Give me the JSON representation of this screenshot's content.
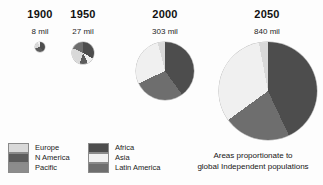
{
  "figure": {
    "title": "",
    "background": "#fdfdfd",
    "caption_line1": "Areas proportionate to",
    "caption_line2": "global Independent populations"
  },
  "colors": {
    "europe": "#d9d9d9",
    "n_america": "#5c5c5c",
    "pacific": "#8c8c8c",
    "africa": "#4d4d4d",
    "asia": "#f0f0f0",
    "latin_america": "#6e6e6e",
    "outline": "#8a8a8a",
    "text": "#1a1a1a"
  },
  "columns": [
    {
      "year": "1900",
      "value": "8 mil"
    },
    {
      "year": "1950",
      "value": "27 mil"
    },
    {
      "year": "2000",
      "value": "303 mil"
    },
    {
      "year": "2050",
      "value": "840 mil"
    }
  ],
  "legend_left": [
    {
      "label": "Europe",
      "color": "#d9d9d9"
    },
    {
      "label": "N America",
      "color": "#5c5c5c"
    },
    {
      "label": "Pacific",
      "color": "#8c8c8c"
    }
  ],
  "legend_right": [
    {
      "label": "Africa",
      "color": "#4d4d4d"
    },
    {
      "label": "Asia",
      "color": "#f0f0f0"
    },
    {
      "label": "Latin America",
      "color": "#6e6e6e"
    }
  ],
  "chart_data": {
    "type": "pie",
    "subtitle": "Areas proportionate to global Independent populations",
    "xlabel": "",
    "ylabel": "",
    "note": "Four proportional-area pie charts; circle area scales with total population.",
    "categories": [
      "Europe",
      "N America",
      "Pacific",
      "Africa",
      "Asia",
      "Latin America"
    ],
    "category_colors": [
      "#d9d9d9",
      "#5c5c5c",
      "#8c8c8c",
      "#4d4d4d",
      "#f0f0f0",
      "#6e6e6e"
    ],
    "charts": [
      {
        "year": "1900",
        "total_label": "8 mil",
        "total": 8,
        "radius_px": 5,
        "slices": [
          {
            "name": "Africa",
            "percent": 40,
            "color": "#4d4d4d"
          },
          {
            "name": "N America",
            "percent": 30,
            "color": "#5c5c5c"
          },
          {
            "name": "Europe",
            "percent": 22,
            "color": "#d9d9d9"
          },
          {
            "name": "Asia",
            "percent": 8,
            "color": "#f0f0f0"
          }
        ]
      },
      {
        "year": "1950",
        "total_label": "27 mil",
        "total": 27,
        "radius_px": 11,
        "slices": [
          {
            "name": "Africa",
            "percent": 33,
            "color": "#4d4d4d"
          },
          {
            "name": "Asia",
            "percent": 10,
            "color": "#f0f0f0"
          },
          {
            "name": "N America",
            "percent": 12,
            "color": "#5c5c5c"
          },
          {
            "name": "Europe",
            "percent": 27,
            "color": "#d9d9d9"
          },
          {
            "name": "Latin America",
            "percent": 18,
            "color": "#6e6e6e"
          }
        ]
      },
      {
        "year": "2000",
        "total_label": "303 mil",
        "total": 303,
        "radius_px": 29,
        "slices": [
          {
            "name": "Africa",
            "percent": 40,
            "color": "#4d4d4d"
          },
          {
            "name": "Latin America",
            "percent": 28,
            "color": "#6e6e6e"
          },
          {
            "name": "Asia",
            "percent": 28,
            "color": "#f0f0f0"
          },
          {
            "name": "Europe",
            "percent": 4,
            "color": "#d9d9d9"
          }
        ]
      },
      {
        "year": "2050",
        "total_label": "840 mil",
        "total": 840,
        "radius_px": 49,
        "slices": [
          {
            "name": "Africa",
            "percent": 43,
            "color": "#4d4d4d"
          },
          {
            "name": "Latin America",
            "percent": 22,
            "color": "#6e6e6e"
          },
          {
            "name": "Asia",
            "percent": 32,
            "color": "#f0f0f0"
          },
          {
            "name": "Europe",
            "percent": 3,
            "color": "#d9d9d9"
          }
        ]
      }
    ]
  }
}
